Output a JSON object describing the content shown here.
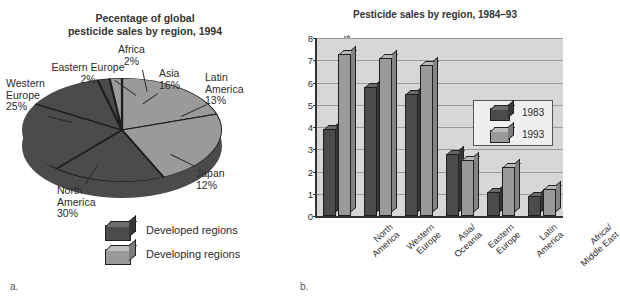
{
  "figure_a": {
    "caption": "a.",
    "title_line1": "Pecentage of global",
    "title_line2": "pesticide sales by region, 1994",
    "legend": [
      {
        "label": "Developed regions",
        "color": "#4b4b4b",
        "icon": "cube-dark-icon"
      },
      {
        "label": "Developing regions",
        "color": "#9a9a9a",
        "icon": "cube-light-icon"
      }
    ],
    "labels": {
      "africa": {
        "name": "Africa",
        "value": "2%"
      },
      "eastern_europe": {
        "name": "Eastern Europe",
        "value": "2%"
      },
      "western_europe_l1": "Western",
      "western_europe_l2": "Europe",
      "western_europe_v": "25%",
      "north_america_l1": "North",
      "north_america_l2": "America",
      "north_america_v": "30%",
      "asia": {
        "name": "Asia",
        "value": "16%"
      },
      "latin_america_l1": "Latin",
      "latin_america_l2": "America",
      "latin_america_v": "13%",
      "japan": {
        "name": "Japan",
        "value": "12%"
      }
    },
    "chart_data": {
      "type": "pie",
      "title": "Pecentage of global pesticide sales by region, 1994",
      "categories": [
        "Asia",
        "Latin America",
        "Japan",
        "North America",
        "Western Europe",
        "Eastern Europe",
        "Africa"
      ],
      "values": [
        16,
        13,
        12,
        30,
        25,
        2,
        2
      ],
      "unit": "percent",
      "group": [
        "Developing regions",
        "Developing regions",
        "Developed regions",
        "Developed regions",
        "Developed regions",
        "Developed regions",
        "Developing regions"
      ],
      "colors": [
        "#9a9a9a",
        "#9a9a9a",
        "#4b4b4b",
        "#4b4b4b",
        "#4b4b4b",
        "#4b4b4b",
        "#9a9a9a"
      ],
      "legend": [
        "Developed regions",
        "Developing regions"
      ],
      "legend_position": "bottom"
    }
  },
  "figure_b": {
    "caption": "b.",
    "title": "Pesticide sales by region, 1984–93",
    "ylabel": "Billion U.S. dollars",
    "yticks": [
      "0",
      "1",
      "2",
      "3",
      "4",
      "5",
      "6",
      "7",
      "8"
    ],
    "legend": [
      {
        "label": "1983",
        "color": "#4b4b4b",
        "icon": "cube-dark-icon"
      },
      {
        "label": "1993",
        "color": "#9a9a9a",
        "icon": "cube-light-icon"
      }
    ],
    "categories": [
      {
        "line1": "North",
        "line2": "America"
      },
      {
        "line1": "Western",
        "line2": "Europe"
      },
      {
        "line1": "Asia/",
        "line2": "Oceania"
      },
      {
        "line1": "Eastern",
        "line2": "Europe"
      },
      {
        "line1": "Latin",
        "line2": "America"
      },
      {
        "line1": "Africa/",
        "line2": "Middle East"
      }
    ],
    "chart_data": {
      "type": "bar",
      "title": "Pesticide sales by region, 1984–93",
      "xlabel": "",
      "ylabel": "Billion U.S. dollars",
      "ylim": [
        0,
        8
      ],
      "ytick_step": 1,
      "grid": true,
      "legend_position": "inside-top-right",
      "categories": [
        "North America",
        "Western Europe",
        "Asia/Oceania",
        "Eastern Europe",
        "Latin America",
        "Africa/Middle East"
      ],
      "series": [
        {
          "name": "1983",
          "color": "#4b4b4b",
          "values": [
            3.9,
            5.8,
            5.5,
            2.8,
            1.1,
            0.9
          ]
        },
        {
          "name": "1993",
          "color": "#9a9a9a",
          "values": [
            7.3,
            7.1,
            6.8,
            2.5,
            2.2,
            1.2
          ]
        }
      ]
    }
  }
}
